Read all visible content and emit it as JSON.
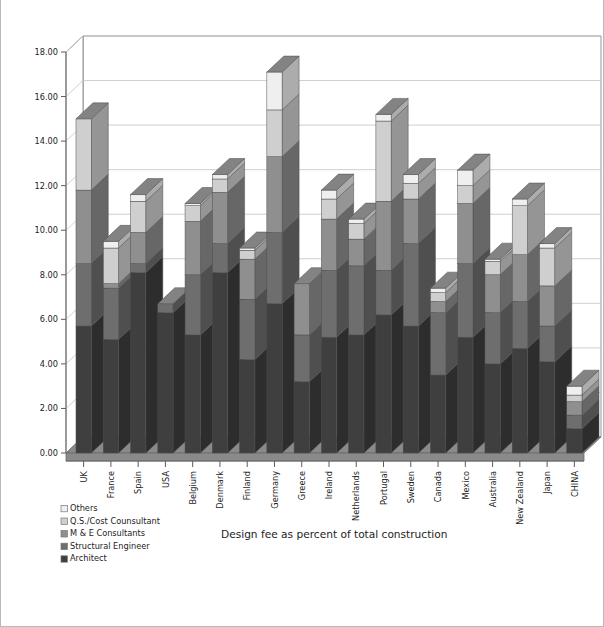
{
  "chart_data": {
    "type": "bar",
    "subtype": "stacked-column-3d",
    "title": "Design fee as percent of total construction",
    "xlabel": "",
    "ylabel": "",
    "ylim": [
      0.0,
      18.0
    ],
    "ytick_step": 2.0,
    "ytick_labels": [
      "0.00",
      "2.00",
      "4.00",
      "6.00",
      "8.00",
      "10.00",
      "12.00",
      "14.00",
      "16.00",
      "18.00"
    ],
    "ytick_values": [
      0.0,
      2.0,
      4.0,
      6.0,
      8.0,
      10.0,
      12.0,
      14.0,
      16.0,
      18.0
    ],
    "grid": true,
    "legend_position": "bottom-left",
    "categories": [
      "UK",
      "France",
      "Spain",
      "USA",
      "Belgium",
      "Denmark",
      "Finland",
      "Germany",
      "Greece",
      "Ireland",
      "Netherlands",
      "Portugal",
      "Sweden",
      "Canada",
      "Mexico",
      "Australia",
      "New Zealand",
      "Japan",
      "CHINA"
    ],
    "series": [
      {
        "name": "Architect",
        "color": "#3f3f3f",
        "values": [
          5.7,
          5.1,
          8.1,
          6.3,
          5.3,
          8.1,
          4.2,
          6.7,
          3.2,
          5.2,
          5.3,
          6.2,
          5.7,
          3.5,
          5.2,
          4.0,
          4.7,
          4.1,
          1.1
        ]
      },
      {
        "name": "Structural Engineer",
        "color": "#6e6e6e",
        "values": [
          2.8,
          2.3,
          0.4,
          0.4,
          2.7,
          1.3,
          2.7,
          3.2,
          2.1,
          3.0,
          3.1,
          2.0,
          3.7,
          2.8,
          3.3,
          2.3,
          2.1,
          1.6,
          0.6
        ]
      },
      {
        "name": "M & E  Consultants",
        "color": "#8f8f8f",
        "values": [
          3.3,
          0.2,
          1.4,
          0.0,
          2.4,
          2.3,
          1.8,
          3.4,
          2.3,
          2.3,
          1.2,
          3.1,
          2.0,
          0.5,
          2.7,
          1.7,
          2.1,
          1.8,
          0.6
        ]
      },
      {
        "name": "Q.S./Cost Counsultant",
        "color": "#cfcfcf",
        "values": [
          3.2,
          1.6,
          1.4,
          0.0,
          0.7,
          0.6,
          0.4,
          2.1,
          0.0,
          0.9,
          0.7,
          3.6,
          0.7,
          0.4,
          0.8,
          0.6,
          2.2,
          1.7,
          0.3
        ]
      },
      {
        "name": "Others",
        "color": "#efefef",
        "values": [
          0.0,
          0.3,
          0.3,
          0.0,
          0.1,
          0.2,
          0.1,
          1.7,
          0.0,
          0.4,
          0.2,
          0.3,
          0.4,
          0.2,
          0.7,
          0.1,
          0.3,
          0.2,
          0.4
        ]
      }
    ],
    "totals": [
      15.0,
      9.5,
      11.6,
      6.7,
      11.2,
      12.5,
      9.2,
      17.1,
      7.6,
      11.8,
      10.5,
      15.2,
      12.5,
      7.4,
      12.7,
      8.7,
      11.4,
      9.4,
      3.0
    ]
  },
  "legend": {
    "items": [
      {
        "label": "Others",
        "swatch": "#efefef"
      },
      {
        "label": "Q.S./Cost Counsultant",
        "swatch": "#cfcfcf"
      },
      {
        "label": "M & E  Consultants",
        "swatch": "#8f8f8f"
      },
      {
        "label": "Structural Engineer",
        "swatch": "#6e6e6e"
      },
      {
        "label": "Architect",
        "swatch": "#3f3f3f"
      }
    ]
  },
  "style": {
    "floor_color": "#8a8a8a",
    "wall_color": "#ffffff",
    "grid_color": "#c4c4c4",
    "axis_color": "#7a7a7a",
    "frame_color": "#b9b9b9"
  }
}
